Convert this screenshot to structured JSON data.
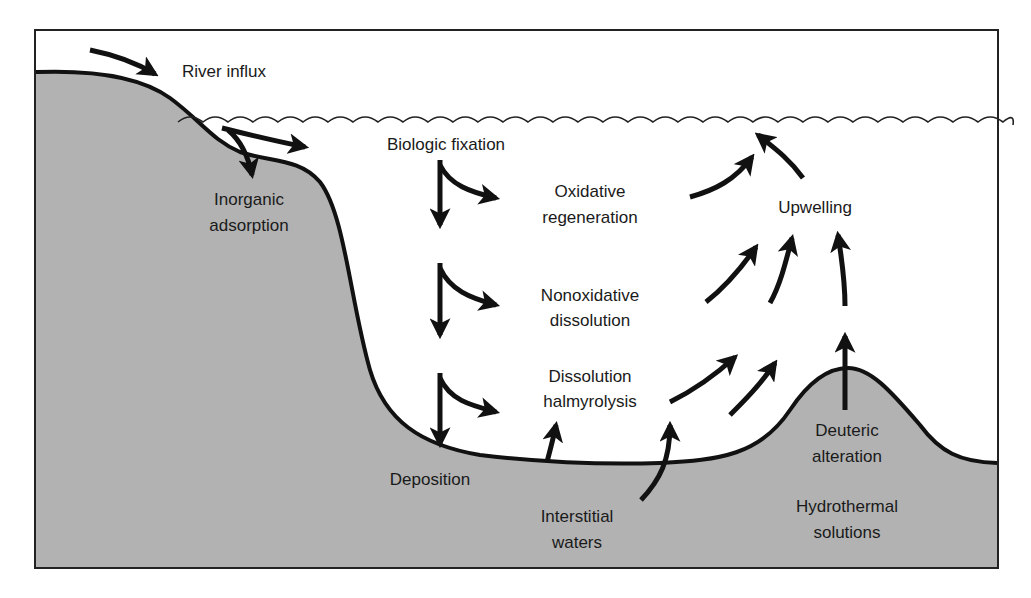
{
  "diagram": {
    "colors": {
      "sediment": "#b2b2b2",
      "water": "#ffffff",
      "outline": "#111111",
      "frame": "#222222"
    },
    "labels": {
      "river_influx": "River influx",
      "biologic_fixation": "Biologic fixation",
      "inorganic_adsorption_1": "Inorganic",
      "inorganic_adsorption_2": "adsorption",
      "oxidative_regeneration_1": "Oxidative",
      "oxidative_regeneration_2": "regeneration",
      "upwelling": "Upwelling",
      "nonoxidative_dissolution_1": "Nonoxidative",
      "nonoxidative_dissolution_2": "dissolution",
      "dissolution_halmyrolysis_1": "Dissolution",
      "dissolution_halmyrolysis_2": "halmyrolysis",
      "deposition": "Deposition",
      "interstitial_waters_1": "Interstitial",
      "interstitial_waters_2": "waters",
      "deuteric_alteration_1": "Deuteric",
      "deuteric_alteration_2": "alteration",
      "hydrothermal_solutions_1": "Hydrothermal",
      "hydrothermal_solutions_2": "solutions"
    },
    "processes": [
      "River influx",
      "Inorganic adsorption",
      "Biologic fixation",
      "Oxidative regeneration",
      "Nonoxidative dissolution",
      "Dissolution halmyrolysis",
      "Deposition",
      "Interstitial waters",
      "Upwelling",
      "Deuteric alteration",
      "Hydrothermal solutions"
    ]
  }
}
